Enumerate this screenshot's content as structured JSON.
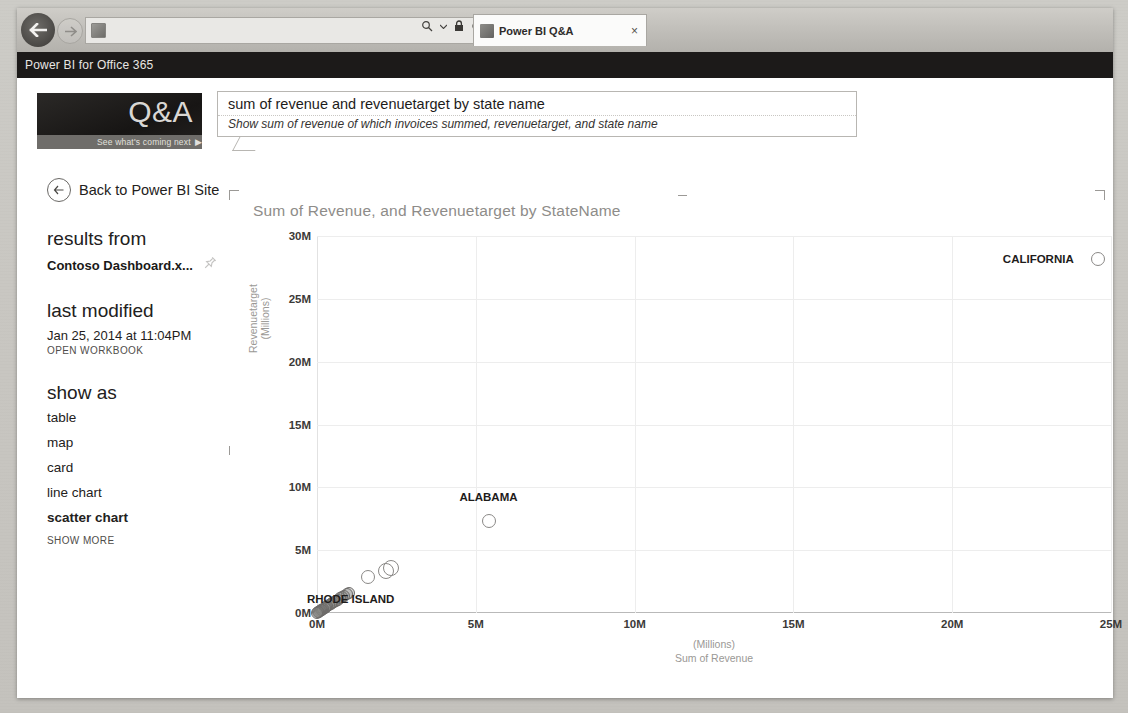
{
  "browser": {
    "address_url": "",
    "tab_title": "Power BI Q&A",
    "tab_close": "×",
    "search_icon": "search-icon",
    "lock_icon": "lock-icon",
    "refresh_icon": "refresh-icon",
    "back_icon": "back-arrow-icon",
    "forward_icon": "forward-arrow-icon"
  },
  "appbar": {
    "title": "Power BI for Office 365"
  },
  "qa": {
    "logo_text": "Q&A",
    "logo_strip": "See what's coming next",
    "strip_arrow": "▶",
    "query": "sum of revenue and revenuetarget by state name",
    "interpretation": "Show sum of revenue of which invoices summed, revenuetarget, and state name"
  },
  "sidebar": {
    "back_label": "Back to Power BI Site",
    "results_from_heading": "results from",
    "workbook_name": "Contoso Dashboard.x...",
    "pin_icon": "pin-icon",
    "last_modified_heading": "last modified",
    "last_modified_value": "Jan 25, 2014 at 11:04PM",
    "open_workbook": "OPEN WORKBOOK",
    "show_as_heading": "show as",
    "show_as_options": [
      {
        "label": "table",
        "active": false
      },
      {
        "label": "map",
        "active": false
      },
      {
        "label": "card",
        "active": false
      },
      {
        "label": "line chart",
        "active": false
      },
      {
        "label": "scatter chart",
        "active": true
      }
    ],
    "show_more": "SHOW MORE"
  },
  "chart_data": {
    "type": "scatter",
    "title": "Sum of Revenue, and Revenuetarget by StateName",
    "xlabel": "Sum of Revenue",
    "xlabel_unit": "(Millions)",
    "ylabel": "Revenuetarget",
    "ylabel_unit": "(Millions)",
    "xlim": [
      0,
      25000000
    ],
    "ylim": [
      0,
      30000000
    ],
    "xticks": [
      "0M",
      "5M",
      "10M",
      "15M",
      "20M",
      "25M"
    ],
    "xtick_values": [
      0,
      5000000,
      10000000,
      15000000,
      20000000,
      25000000
    ],
    "yticks": [
      "0M",
      "5M",
      "10M",
      "15M",
      "20M",
      "25M",
      "30M"
    ],
    "ytick_values": [
      0,
      5000000,
      10000000,
      15000000,
      20000000,
      25000000,
      30000000
    ],
    "grid": true,
    "legend": "none",
    "points": [
      {
        "label": "CALIFORNIA",
        "x": 24600000,
        "y": 28200000,
        "r": 6,
        "dense": false,
        "label_dx": -60,
        "label_dy": 0
      },
      {
        "label": "ALABAMA",
        "x": 5400000,
        "y": 7300000,
        "r": 6,
        "dense": false,
        "label_dx": 0,
        "label_dy": -24
      },
      {
        "label": "",
        "x": 2330000,
        "y": 3600000,
        "r": 7,
        "dense": false
      },
      {
        "label": "",
        "x": 2180000,
        "y": 3380000,
        "r": 7,
        "dense": false
      },
      {
        "label": "",
        "x": 1620000,
        "y": 2870000,
        "r": 6,
        "dense": false
      },
      {
        "label": "",
        "x": 1010000,
        "y": 1620000,
        "r": 5,
        "dense": true
      },
      {
        "label": "",
        "x": 930000,
        "y": 1500000,
        "r": 5,
        "dense": true
      },
      {
        "label": "",
        "x": 860000,
        "y": 1390000,
        "r": 5,
        "dense": true
      },
      {
        "label": "",
        "x": 790000,
        "y": 1270000,
        "r": 5,
        "dense": true
      },
      {
        "label": "",
        "x": 720000,
        "y": 1160000,
        "r": 5,
        "dense": true
      },
      {
        "label": "",
        "x": 660000,
        "y": 1050000,
        "r": 5,
        "dense": true
      },
      {
        "label": "",
        "x": 600000,
        "y": 960000,
        "r": 5,
        "dense": true
      },
      {
        "label": "",
        "x": 540000,
        "y": 870000,
        "r": 5,
        "dense": true
      },
      {
        "label": "",
        "x": 480000,
        "y": 780000,
        "r": 5,
        "dense": true
      },
      {
        "label": "",
        "x": 430000,
        "y": 700000,
        "r": 5,
        "dense": true
      },
      {
        "label": "",
        "x": 380000,
        "y": 620000,
        "r": 5,
        "dense": true
      },
      {
        "label": "",
        "x": 330000,
        "y": 540000,
        "r": 5,
        "dense": true
      },
      {
        "label": "",
        "x": 285000,
        "y": 470000,
        "r": 5,
        "dense": true
      },
      {
        "label": "",
        "x": 240000,
        "y": 400000,
        "r": 5,
        "dense": true
      },
      {
        "label": "",
        "x": 200000,
        "y": 335000,
        "r": 5,
        "dense": true
      },
      {
        "label": "",
        "x": 160000,
        "y": 270000,
        "r": 5,
        "dense": true
      },
      {
        "label": "",
        "x": 125000,
        "y": 210000,
        "r": 5,
        "dense": true
      },
      {
        "label": "",
        "x": 92000,
        "y": 155000,
        "r": 5,
        "dense": true
      },
      {
        "label": "",
        "x": 62000,
        "y": 105000,
        "r": 5,
        "dense": true
      },
      {
        "label": "",
        "x": 36000,
        "y": 62000,
        "r": 5,
        "dense": true
      },
      {
        "label": "",
        "x": 15000,
        "y": 26000,
        "r": 5,
        "dense": true
      }
    ],
    "annotations": [
      {
        "text": "RHODE ISLAND",
        "x": 1060000,
        "y": 1150000
      }
    ]
  }
}
